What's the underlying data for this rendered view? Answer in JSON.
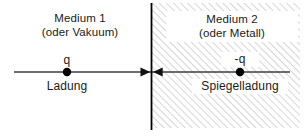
{
  "figure": {
    "width": 308,
    "height": 136,
    "background_color": "#ffffff"
  },
  "colors": {
    "text": "#1a1a1a",
    "axis_line": "#3c3c3c",
    "boundary_line": "#000000",
    "charge_dot": "#000000",
    "hatch_line": "#c8c8c8",
    "label_backdrop": "#ffffff"
  },
  "regions": {
    "left": {
      "name": "Medium 1",
      "title": "Medium 1",
      "subtitle": "(oder Vakuum)",
      "fill": "plain-white"
    },
    "right": {
      "name": "Medium 2",
      "title": "Medium 2",
      "subtitle": "(oder Metall)",
      "fill": "diagonal-hatch"
    }
  },
  "boundary": {
    "name": "interface-boundary",
    "x": 151,
    "y_top": 3,
    "y_bottom": 130,
    "stroke_width": 1.6
  },
  "axis": {
    "name": "horizontal-axis",
    "y": 72,
    "x_start": 14,
    "x_end": 290,
    "stroke_width": 1.6
  },
  "arrows": [
    {
      "name": "arrow-toward-boundary-from-left",
      "direction": "right",
      "tip_x": 150,
      "y": 72
    },
    {
      "name": "arrow-toward-boundary-from-right",
      "direction": "left",
      "tip_x": 153,
      "y": 72
    }
  ],
  "charges": [
    {
      "id": "source-charge",
      "symbol": "q",
      "name": "Ladung",
      "x": 67,
      "y": 72,
      "radius": 4
    },
    {
      "id": "mirror-charge",
      "symbol": "-q",
      "name": "Spiegelladung",
      "x": 240,
      "y": 72,
      "radius": 4
    }
  ],
  "hatch": {
    "x": 151,
    "y": 3,
    "width": 149,
    "height": 125,
    "angle_deg": 45,
    "spacing_px": 5,
    "stroke_width": 1.4
  }
}
